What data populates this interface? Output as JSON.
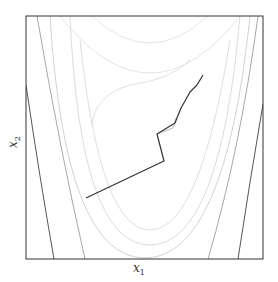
{
  "chart_data": {
    "type": "contour",
    "title": "",
    "xlabel": "x1",
    "ylabel": "x2",
    "xlabel_display": {
      "base": "x",
      "sub": "1"
    },
    "ylabel_display": {
      "base": "x",
      "sub": "2"
    },
    "grid": false,
    "legend": null,
    "ticks": "none",
    "frame": {
      "left": 26,
      "top": 16,
      "right": 263,
      "bottom": 259,
      "color": "#333333"
    },
    "contours": {
      "description": "Nested parabolic (banana-shaped) level curves opening upward, minimum valley near lower center; outer curves darker, inner curves lighter gray",
      "levels": [
        {
          "id": "c1",
          "stroke": "#e6e6e6",
          "path": "M 92 16 Q 150 70 208 16"
        },
        {
          "id": "c2",
          "stroke": "#e4e4e4",
          "path": "M 60 16 Q 150 130 240 16"
        },
        {
          "id": "c3",
          "stroke": "#e0e0e0",
          "path": "M 92 125 Q 95 95 130 85 Q 170 80 190 60"
        },
        {
          "id": "c4",
          "stroke": "#dedede",
          "path": "M 80 40 Q 100 230 150 230 Q 200 230 230 40"
        },
        {
          "id": "c5",
          "stroke": "#dcdcdc",
          "path": "M 70 16 Q 80 245 150 245 Q 220 245 240 16"
        },
        {
          "id": "c6",
          "stroke": "#d2d2d2",
          "path": "M 50 16 Q 65 258 145 258 Q 225 258 250 16"
        },
        {
          "id": "c7",
          "stroke": "#a8a8a8",
          "path": "M 37 16 Q 60 150 85 259"
        },
        {
          "id": "c8",
          "stroke": "#a8a8a8",
          "path": "M 258 16 Q 240 150 208 259"
        },
        {
          "id": "c9",
          "stroke": "#555555",
          "path": "M 26 85 Q 40 180 54 259"
        },
        {
          "id": "c10",
          "stroke": "#555555",
          "path": "M 263 104 Q 250 180 238 259"
        },
        {
          "id": "c11",
          "stroke": "#444444",
          "path": "M 26 160 L 26 160"
        }
      ]
    },
    "trajectories": [
      {
        "name": "optimizer-path-main",
        "stroke": "#333333",
        "points": [
          [
            86,
            198
          ],
          [
            164,
            161
          ],
          [
            157,
            134
          ],
          [
            175,
            123
          ],
          [
            181,
            108
          ],
          [
            185,
            101
          ],
          [
            190,
            92
          ],
          [
            197,
            85
          ],
          [
            203,
            75
          ]
        ]
      },
      {
        "name": "optimizer-path-secondary",
        "stroke": "#aaaaaa",
        "points": [
          [
            157,
            134
          ],
          [
            173,
            128
          ],
          [
            176,
            118
          ]
        ]
      }
    ]
  }
}
